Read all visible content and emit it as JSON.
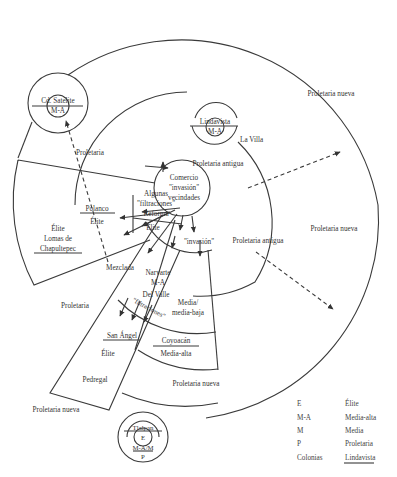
{
  "diagram": {
    "type": "urban-structure-model",
    "center": {
      "lines": [
        "Comercio",
        "\"invasión\"",
        "vecindades"
      ]
    },
    "regions": {
      "proletaria_nueva_ne": "Proletaria nueva",
      "proletaria_nueva_e": "Proletaria nueva",
      "proletaria_nueva_s": "Proletaria nueva",
      "proletaria_nueva_sw": "Proletaria nueva",
      "proletaria_antigua_n": "Proletaria antigua",
      "proletaria_antigua_e": "Proletaria antigua",
      "la_villa": "La Villa",
      "proletaria_nw": "Proletaria",
      "proletaria_w": "Proletaria",
      "mezclada": "Mezclada",
      "media_media_baja_1": "Media/",
      "media_media_baja_2": "media-baja",
      "invasion_s": "\"invasión\"",
      "algunas_1": "Algunas",
      "algunas_2": "\"filtraciones\"",
      "reforma": "Reforma",
      "elite_inner": "Élite",
      "polanco": "Polanco",
      "polanco_elite": "Élite",
      "lomas_elite": "Élite",
      "lomas_1": "Lomas de",
      "lomas_2": "Chapultepec",
      "narvarte": "Narvarte",
      "narvarte_ma": "M-A",
      "del_valle": "Del Valle",
      "filtraciones": "\"filtraciones\"",
      "san_angel": "San Ángel",
      "san_angel_elite": "Élite",
      "pedregal": "Pedregal",
      "coyoacan": "Coyoacán",
      "coyoacan_ma": "Media-alta"
    },
    "satellites": {
      "cd_satelite": {
        "name": "Cd. Satélite",
        "class": "M-A"
      },
      "lindavista": {
        "name": "Lindavista",
        "class": "M-A"
      },
      "tlalpan": {
        "name": "Tlalpan",
        "class_1": "E",
        "class_2": "M-A/M",
        "class_3": "P"
      }
    }
  },
  "legend": {
    "items": [
      {
        "abbr": "E",
        "meaning": "Élite"
      },
      {
        "abbr": "M-A",
        "meaning": "Media-alta"
      },
      {
        "abbr": "M",
        "meaning": "Media"
      },
      {
        "abbr": "P",
        "meaning": "Proletaria"
      },
      {
        "abbr": "Colonias",
        "meaning": "Lindavista"
      }
    ]
  }
}
